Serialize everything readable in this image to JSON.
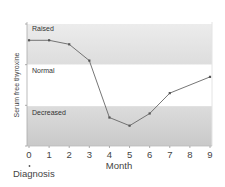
{
  "chart_data": {
    "type": "line",
    "title": "",
    "xlabel": "Month",
    "ylabel": "Serum free thyroxine",
    "x": [
      0,
      1,
      2,
      3,
      4,
      5,
      6,
      7,
      9
    ],
    "series": [
      {
        "name": "Serum free thyroxine",
        "values": [
          2.6,
          2.6,
          2.5,
          2.1,
          0.7,
          0.5,
          0.8,
          1.3,
          1.7
        ]
      }
    ],
    "x_tick_labels": [
      "0",
      "1",
      "2",
      "3",
      "4",
      "5",
      "6",
      "7",
      "8",
      "9"
    ],
    "xlim": [
      0,
      9
    ],
    "ylim": [
      0,
      3
    ],
    "y_ticks_unlabeled": [
      0,
      1,
      2,
      3
    ],
    "bands": [
      {
        "label": "Raised",
        "from": 2.0,
        "to": 3.0,
        "color": "#e3e3e3"
      },
      {
        "label": "Normal",
        "from": 0.98,
        "to": 2.0,
        "color": "#ffffff"
      },
      {
        "label": "Decreased",
        "from": 0.0,
        "to": 0.98,
        "color": "#d2d2d2"
      }
    ],
    "annotations": [
      {
        "x": 0,
        "text": "Diagnosis",
        "position": "below-axis"
      }
    ],
    "grid": false,
    "legend": "none",
    "line_color": "#666666",
    "marker_color": "#555555"
  },
  "labels": {
    "raised": "Raised",
    "normal": "Normal",
    "decreased": "Decreased",
    "xlabel": "Month",
    "ylabel": "Serum free thyroxine",
    "diagnosis": "Diagnosis"
  }
}
